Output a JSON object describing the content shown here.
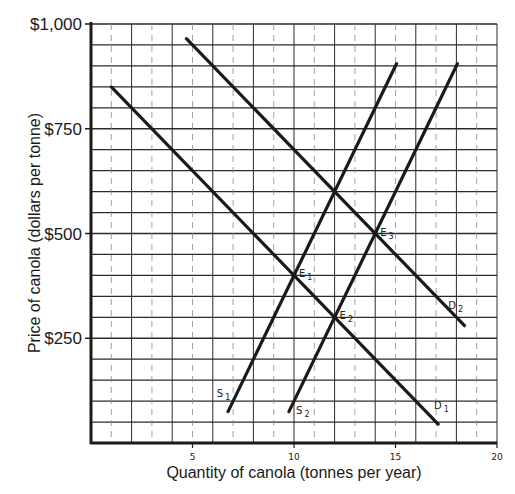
{
  "chart_data": {
    "type": "line",
    "title": "",
    "xlabel": "Quantity of canola (tonnes per year)",
    "ylabel": "Price of canola (dollars per tonne)",
    "xlim": [
      0,
      20
    ],
    "ylim": [
      0,
      1000
    ],
    "x_ticks": [
      {
        "value": 5,
        "label": "5"
      },
      {
        "value": 10,
        "label": "10"
      },
      {
        "value": 15,
        "label": "15"
      },
      {
        "value": 20,
        "label": "20"
      }
    ],
    "y_ticks": [
      {
        "value": 250,
        "label": "$250"
      },
      {
        "value": 500,
        "label": "$500"
      },
      {
        "value": 750,
        "label": "$750"
      },
      {
        "value": 1000,
        "label": "$1,000"
      }
    ],
    "grid": {
      "on": true,
      "x_step": 1,
      "y_step": 50
    },
    "legend": "none (curves labeled inline)",
    "series": [
      {
        "name": "D1",
        "label": "D",
        "sub": "1",
        "kind": "demand",
        "points": [
          [
            1.0,
            850
          ],
          [
            17.1,
            45
          ]
        ],
        "label_at": [
          16.9,
          80
        ]
      },
      {
        "name": "D2",
        "label": "D",
        "sub": "2",
        "kind": "demand",
        "points": [
          [
            4.7,
            965
          ],
          [
            18.4,
            280
          ]
        ],
        "label_at": [
          17.6,
          320
        ]
      },
      {
        "name": "S1",
        "label": "S",
        "sub": "1",
        "kind": "supply",
        "points": [
          [
            6.75,
            75
          ],
          [
            15.05,
            905
          ]
        ],
        "label_at": [
          6.2,
          110
        ]
      },
      {
        "name": "S2",
        "label": "S",
        "sub": "2",
        "kind": "supply",
        "points": [
          [
            9.75,
            75
          ],
          [
            18.05,
            905
          ]
        ],
        "label_at": [
          10.1,
          70
        ]
      }
    ],
    "annotations": [
      {
        "label": "E",
        "sub": "1",
        "x": 10,
        "y": 400,
        "text": "E1: D1 ∩ S1"
      },
      {
        "label": "E",
        "sub": "2",
        "x": 12,
        "y": 300,
        "text": "E2: D1 ∩ S2"
      },
      {
        "label": "E",
        "sub": "3",
        "x": 14,
        "y": 500,
        "text": "E3: D2 ∩ S2"
      }
    ]
  },
  "layout": {
    "plot": {
      "left": 91,
      "top": 24,
      "right": 497,
      "bottom": 443
    },
    "colors": {
      "ink": "#1a1a1a",
      "grid": "#2a2a2a",
      "grid_dashed": "#8a8a8a",
      "background": "#ffffff"
    }
  }
}
